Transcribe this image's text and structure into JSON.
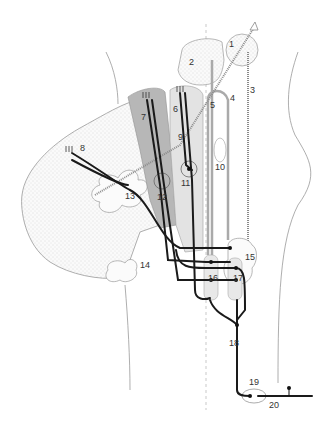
{
  "figure": {
    "type": "anatomical-neural-pathway-diagram",
    "colors": {
      "background": "#ffffff",
      "nerve": "#1a1a1a",
      "dark_region": "#b5b5b5",
      "light_region": "#e2e2e2",
      "stippled_region": "#f4f4f4",
      "outline": "#999999"
    },
    "labels": [
      {
        "id": "1",
        "text": "1",
        "x": 229,
        "y": 47
      },
      {
        "id": "2",
        "text": "2",
        "x": 189,
        "y": 65
      },
      {
        "id": "3",
        "text": "3",
        "x": 250,
        "y": 93
      },
      {
        "id": "4",
        "text": "4",
        "x": 230,
        "y": 101
      },
      {
        "id": "5",
        "text": "5",
        "x": 210,
        "y": 108
      },
      {
        "id": "6",
        "text": "6",
        "x": 173,
        "y": 112
      },
      {
        "id": "7",
        "text": "7",
        "x": 141,
        "y": 120
      },
      {
        "id": "8",
        "text": "8",
        "x": 80,
        "y": 151
      },
      {
        "id": "9",
        "text": "9",
        "x": 178,
        "y": 140
      },
      {
        "id": "10",
        "text": "10",
        "x": 215,
        "y": 170
      },
      {
        "id": "11",
        "text": "11",
        "x": 181,
        "y": 186
      },
      {
        "id": "12",
        "text": "12",
        "x": 157,
        "y": 200
      },
      {
        "id": "13",
        "text": "13",
        "x": 125,
        "y": 199
      },
      {
        "id": "14",
        "text": "14",
        "x": 140,
        "y": 268
      },
      {
        "id": "15",
        "text": "15",
        "x": 245,
        "y": 260
      },
      {
        "id": "16",
        "text": "16",
        "x": 208,
        "y": 281
      },
      {
        "id": "17",
        "text": "17",
        "x": 233,
        "y": 281
      },
      {
        "id": "18",
        "text": "18",
        "x": 229,
        "y": 346
      },
      {
        "id": "19",
        "text": "19",
        "x": 249,
        "y": 385
      },
      {
        "id": "20",
        "text": "20",
        "x": 269,
        "y": 408
      }
    ]
  }
}
